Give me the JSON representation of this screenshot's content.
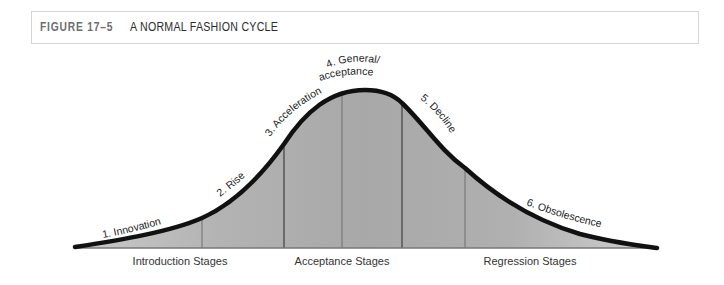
{
  "header": {
    "figure_number": "FIGURE 17–5",
    "title": "A NORMAL FASHION CYCLE"
  },
  "stages": {
    "introduction": "Introduction Stages",
    "acceptance": "Acceptance Stages",
    "regression": "Regression Stages"
  },
  "curve_labels": [
    {
      "id": "innovation",
      "text": "1. Innovation"
    },
    {
      "id": "rise",
      "text": "2. Rise"
    },
    {
      "id": "acceleration",
      "text": "3. Acceleration"
    },
    {
      "id": "general_acceptance_line1",
      "text": "4. General/"
    },
    {
      "id": "general_acceptance_line2",
      "text": "acceptance"
    },
    {
      "id": "decline",
      "text": "5. Decline"
    },
    {
      "id": "obsolescence",
      "text": "6. Obsolescence"
    }
  ],
  "colors": {
    "curve": "#111111",
    "fill": "#a9a9a9",
    "divider": "#6f6f6f",
    "baseline": "#777777"
  }
}
